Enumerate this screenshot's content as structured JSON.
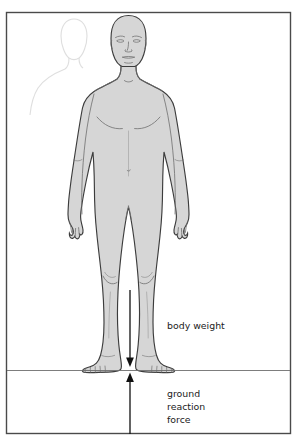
{
  "figure": {
    "frame": {
      "border_color": "#4a4a4a",
      "background_color": "#ffffff",
      "x": 6,
      "y": 12,
      "width": 285,
      "height": 422
    },
    "ground_line": {
      "label": "ground-line",
      "y": 370,
      "x_start": 7,
      "x_end": 290,
      "color": "#6e6e6e"
    },
    "body": {
      "fill_color": "#d6d6d6",
      "outline_color": "#3c3c3c",
      "detail_color": "#6e6e6e",
      "ghost_fill_color": "#ffffff",
      "ghost_outline_color": "#c9c9c9"
    },
    "arrows": {
      "color": "#101010",
      "axis_x": 130,
      "body_weight": {
        "name": "body-weight-arrow",
        "direction": "down",
        "line_top_y": 290,
        "tip_y": 365
      },
      "ground_reaction": {
        "name": "ground-reaction-force-arrow",
        "direction": "up",
        "line_bottom_y": 434,
        "tip_y": 371
      }
    },
    "labels": {
      "body_weight": "body weight",
      "ground_reaction_lines": [
        "ground",
        "reaction",
        "force"
      ],
      "body_weight_pos": {
        "x": 167,
        "y": 326
      },
      "ground_reaction_pos": {
        "x": 167,
        "y": 397
      },
      "line_height": 13,
      "font_size": 9.4,
      "color": "#1b1b1b"
    }
  }
}
